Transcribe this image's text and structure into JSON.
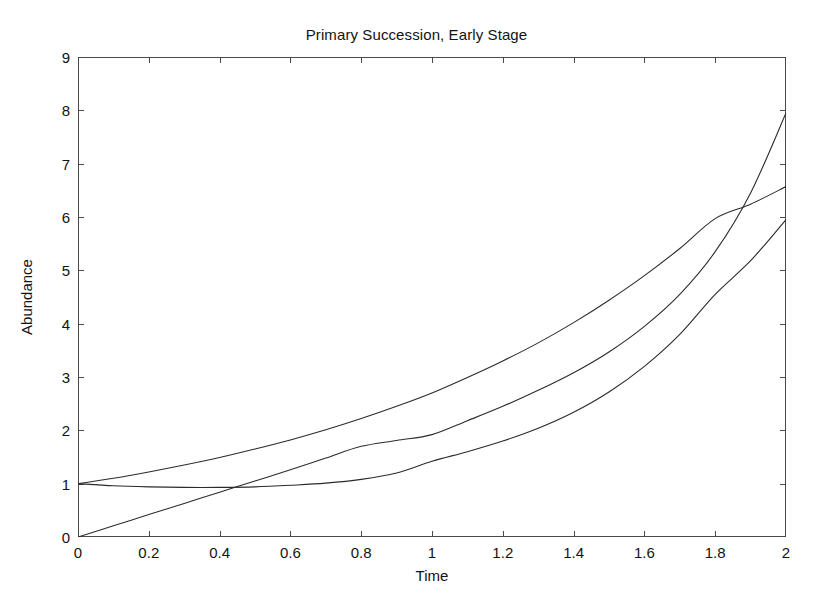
{
  "chart_data": {
    "type": "line",
    "title": "Primary Succession, Early Stage",
    "xlabel": "Time",
    "ylabel": "Abundance",
    "xlim": [
      0,
      2
    ],
    "ylim": [
      0,
      9
    ],
    "xticks": [
      0,
      0.2,
      0.4,
      0.6,
      0.8,
      1,
      1.2,
      1.4,
      1.6,
      1.8,
      2
    ],
    "xtick_labels": [
      "0",
      "0.2",
      "0.4",
      "0.6",
      "0.8",
      "1",
      "1.2",
      "1.4",
      "1.6",
      "1.8",
      "2"
    ],
    "yticks": [
      0,
      1,
      2,
      3,
      4,
      5,
      6,
      7,
      8,
      9
    ],
    "ytick_labels": [
      "0",
      "1",
      "2",
      "3",
      "4",
      "5",
      "6",
      "7",
      "8",
      "9"
    ],
    "grid": false,
    "legend": null,
    "line_color": "#2b2b2b",
    "line_width": 1.1,
    "axis_color": "#4a4a4a",
    "background": "#ffffff",
    "tick_direction": "in",
    "box": true,
    "x": [
      0,
      0.1,
      0.2,
      0.3,
      0.4,
      0.5,
      0.6,
      0.7,
      0.8,
      0.9,
      1,
      1.1,
      1.2,
      1.3,
      1.4,
      1.5,
      1.6,
      1.7,
      1.8,
      1.9,
      2
    ],
    "series": [
      {
        "name": "curve-1",
        "values": [
          1.0,
          1.1,
          1.22,
          1.35,
          1.49,
          1.65,
          1.82,
          2.01,
          2.22,
          2.45,
          2.7,
          2.99,
          3.3,
          3.64,
          4.02,
          4.44,
          4.9,
          5.41,
          5.97,
          6.24,
          6.57
        ]
      },
      {
        "name": "curve-2",
        "values": [
          0.0,
          0.21,
          0.42,
          0.63,
          0.84,
          1.05,
          1.26,
          1.48,
          1.7,
          1.81,
          1.92,
          2.18,
          2.45,
          2.75,
          3.08,
          3.47,
          3.95,
          4.55,
          5.35,
          6.45,
          7.95
        ]
      },
      {
        "name": "curve-3",
        "values": [
          1.0,
          0.96,
          0.94,
          0.93,
          0.93,
          0.94,
          0.97,
          1.01,
          1.08,
          1.2,
          1.42,
          1.6,
          1.8,
          2.04,
          2.34,
          2.72,
          3.2,
          3.8,
          4.55,
          5.18,
          5.95
        ]
      }
    ]
  }
}
